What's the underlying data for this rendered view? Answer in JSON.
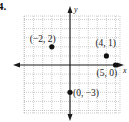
{
  "problem": {
    "number": "4."
  },
  "chart_data": {
    "type": "scatter",
    "title": "",
    "xlabel": "x",
    "ylabel": "y",
    "xlim": [
      -5,
      5
    ],
    "ylim": [
      -5,
      5
    ],
    "grid": true,
    "points": [
      {
        "x": -2,
        "y": 2,
        "label": "(−2, 2)"
      },
      {
        "x": 4,
        "y": 1,
        "label": "(4, 1)"
      },
      {
        "x": 5,
        "y": 0,
        "label": "(5, 0)"
      },
      {
        "x": 0,
        "y": -3,
        "label": "(0, −3)"
      }
    ]
  },
  "colors": {
    "grid": "#b8b8b8",
    "axis": "#1a1a1a",
    "point": "#111111"
  }
}
